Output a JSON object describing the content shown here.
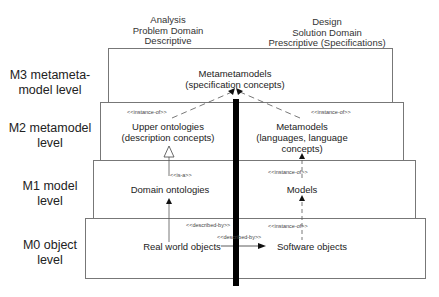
{
  "columns": {
    "left": [
      "Analysis",
      "Problem Domain",
      "Descriptive"
    ],
    "right": [
      "Design",
      "Solution Domain",
      "Prescriptive (Specifications)"
    ]
  },
  "levels": [
    {
      "id": "M3",
      "label_line1": "M3 metameta-",
      "label_line2": "model level"
    },
    {
      "id": "M2",
      "label_line1": "M2 metamodel",
      "label_line2": "level"
    },
    {
      "id": "M1",
      "label_line1": "M1 model",
      "label_line2": "level"
    },
    {
      "id": "M0",
      "label_line1": "M0 object",
      "label_line2": "level"
    }
  ],
  "nodes": {
    "metametamodels": {
      "line1": "Metametamodels",
      "line2": "(specification concepts)"
    },
    "upper_ontologies": {
      "line1": "Upper ontologies",
      "line2": "(description concepts)"
    },
    "metamodels": {
      "line1": "Metamodels",
      "line2": "(languages, language",
      "line3": "concepts)"
    },
    "domain_ontologies": {
      "line1": "Domain ontologies"
    },
    "models": {
      "line1": "Models"
    },
    "real_world_objects": {
      "line1": "Real world objects"
    },
    "software_objects": {
      "line1": "Software objects"
    }
  },
  "relations": {
    "upper_instance_of": "<<instance-of>>",
    "meta_instance_of": "<<instance-of>>",
    "is_a": "<<is-a>>",
    "models_instance_of": "<<instance-of>>",
    "rwo_described_by": "<<described-by>>",
    "so_instance_of": "<<instance-of>>",
    "rwo_so_described_by": "<<described-by>>"
  },
  "colors": {
    "box_border": "#777777",
    "divider": "#000000",
    "text": "#222222"
  }
}
